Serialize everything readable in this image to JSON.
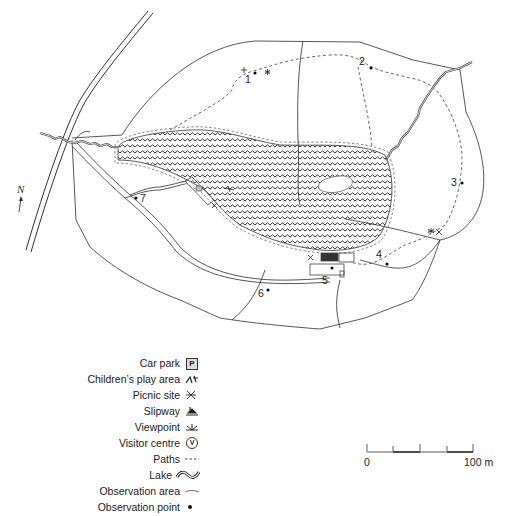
{
  "map": {
    "title": "Park site map with lake, paths and observation points",
    "north_arrow_symbol": "N",
    "observation_points": [
      {
        "id": "1",
        "label": "1"
      },
      {
        "id": "2",
        "label": "2"
      },
      {
        "id": "3",
        "label": "3"
      },
      {
        "id": "4",
        "label": "4"
      },
      {
        "id": "5",
        "label": "5"
      },
      {
        "id": "6",
        "label": "6"
      },
      {
        "id": "7",
        "label": "7"
      }
    ]
  },
  "legend": {
    "items": [
      {
        "label": "Car park",
        "icon": "car-park-icon",
        "glyph": "P"
      },
      {
        "label": "Children’s play area",
        "icon": "play-area-icon",
        "glyph": "⛹"
      },
      {
        "label": "Picnic site",
        "icon": "picnic-icon",
        "glyph": "⨯"
      },
      {
        "label": "Slipway",
        "icon": "slipway-icon",
        "glyph": "⛵"
      },
      {
        "label": "Viewpoint",
        "icon": "viewpoint-icon",
        "glyph": "✳"
      },
      {
        "label": "Visitor centre",
        "icon": "visitor-centre-icon",
        "glyph": "V"
      },
      {
        "label": "Paths",
        "icon": "paths-icon",
        "glyph": "----"
      },
      {
        "label": "Lake",
        "icon": "lake-icon",
        "glyph": "≋"
      },
      {
        "label": "Observation area",
        "icon": "observation-area-icon",
        "glyph": "~"
      },
      {
        "label": "Observation point",
        "icon": "observation-point-icon",
        "glyph": "●"
      }
    ]
  },
  "scale_bar": {
    "start_label": "0",
    "end_label": "100 m"
  },
  "colors": {
    "line": "#333333",
    "path": "#555555",
    "background": "#ffffff"
  }
}
